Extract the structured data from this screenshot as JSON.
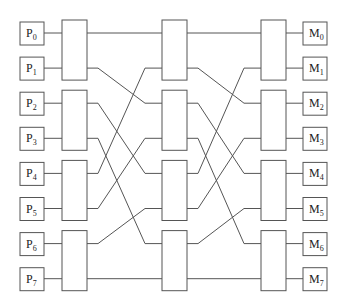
{
  "processors": [
    {
      "prefix": "P",
      "index": "0"
    },
    {
      "prefix": "P",
      "index": "1"
    },
    {
      "prefix": "P",
      "index": "2"
    },
    {
      "prefix": "P",
      "index": "3"
    },
    {
      "prefix": "P",
      "index": "4"
    },
    {
      "prefix": "P",
      "index": "5"
    },
    {
      "prefix": "P",
      "index": "6"
    },
    {
      "prefix": "P",
      "index": "7"
    }
  ],
  "memories": [
    {
      "prefix": "M",
      "index": "0"
    },
    {
      "prefix": "M",
      "index": "1"
    },
    {
      "prefix": "M",
      "index": "2"
    },
    {
      "prefix": "M",
      "index": "3"
    },
    {
      "prefix": "M",
      "index": "4"
    },
    {
      "prefix": "M",
      "index": "5"
    },
    {
      "prefix": "M",
      "index": "6"
    },
    {
      "prefix": "M",
      "index": "7"
    }
  ],
  "stages": 3,
  "switches_per_stage": 4,
  "inter_stage_permutation": [
    0,
    2,
    4,
    6,
    1,
    3,
    5,
    7
  ],
  "colors": {
    "stroke": "#555555",
    "text": "#222222",
    "background": "#ffffff"
  }
}
